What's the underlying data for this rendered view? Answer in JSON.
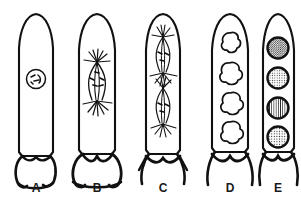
{
  "figure": {
    "ink_color": "#111111",
    "background_color": "#ffffff",
    "stage_count": 5
  },
  "stages": [
    {
      "id": "A",
      "label": "A",
      "label_x": 36,
      "label_y": 188,
      "center_x": 36,
      "body_top": 14,
      "body_bottom": 158,
      "half_width": 17,
      "description": "young ascus with single diploid nucleus",
      "content": "nucleus",
      "nucleus": {
        "cx": 36,
        "cy": 79,
        "r": 10
      },
      "spindles": 0,
      "spores": 0
    },
    {
      "id": "B",
      "label": "B",
      "label_x": 97,
      "label_y": 188,
      "center_x": 97,
      "body_top": 14,
      "body_bottom": 155,
      "half_width": 18,
      "description": "meiosis I, single spindle with astral rays",
      "content": "spindle",
      "spindles": 1,
      "spindle_centers": [
        84
      ],
      "spores": 0
    },
    {
      "id": "C",
      "label": "C",
      "label_x": 163,
      "label_y": 188,
      "center_x": 163,
      "body_top": 14,
      "body_bottom": 155,
      "half_width": 17,
      "description": "meiosis II, two spindles stacked vertically",
      "content": "spindle",
      "spindles": 2,
      "spindle_centers": [
        55,
        104
      ],
      "spores": 0
    },
    {
      "id": "D",
      "label": "D",
      "label_x": 230,
      "label_y": 188,
      "center_x": 230,
      "body_top": 14,
      "body_bottom": 152,
      "half_width": 18,
      "description": "four lobed amoeboid ascospore initials",
      "content": "spore-initials",
      "spindles": 0,
      "spores": 4,
      "spore_centers_y": [
        44,
        75,
        105,
        134
      ]
    },
    {
      "id": "E",
      "label": "E",
      "label_x": 278,
      "label_y": 188,
      "center_x": 278,
      "body_top": 14,
      "body_bottom": 152,
      "half_width": 15,
      "description": "four mature round ascospores with stippled walls",
      "content": "mature-spores",
      "spindles": 0,
      "spores": 4,
      "spore_centers_y": [
        48,
        79,
        108,
        137
      ],
      "spore_radius": 11
    }
  ]
}
